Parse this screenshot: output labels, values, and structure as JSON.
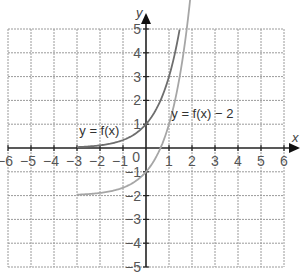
{
  "chart_data": {
    "type": "line",
    "title": "",
    "xlabel": "x",
    "ylabel": "y",
    "xlim": [
      -6,
      6
    ],
    "ylim": [
      -5,
      5
    ],
    "grid": true,
    "x_ticks": [
      "−6",
      "−5",
      "−4",
      "−3",
      "−2",
      "−1",
      "0",
      "1",
      "2",
      "3",
      "4",
      "5",
      "6"
    ],
    "y_ticks": [
      "5",
      "4",
      "3",
      "2",
      "1",
      "−1",
      "−2",
      "−3",
      "−4",
      "−5"
    ],
    "origin_label": "0",
    "series": [
      {
        "name": "y = f(x)",
        "color": "#6e6e6e",
        "x": [
          -3,
          -2,
          -1,
          0,
          1,
          1.46
        ],
        "y": [
          0.04,
          0.11,
          0.33,
          1,
          3,
          5
        ],
        "asymptote": 0
      },
      {
        "name": "y = f(x) − 2",
        "color": "#a6a6a6",
        "x": [
          -3,
          -2,
          -1,
          0,
          1,
          1.95
        ],
        "y": [
          -1.96,
          -1.89,
          -1.67,
          -1,
          1,
          5
        ],
        "asymptote": -2
      }
    ],
    "annotations": [
      {
        "text": "y = f(x)",
        "x": -2.9,
        "y": 0.55
      },
      {
        "text": "y = f(x) − 2",
        "x": 1.1,
        "y": 1.25
      }
    ]
  }
}
